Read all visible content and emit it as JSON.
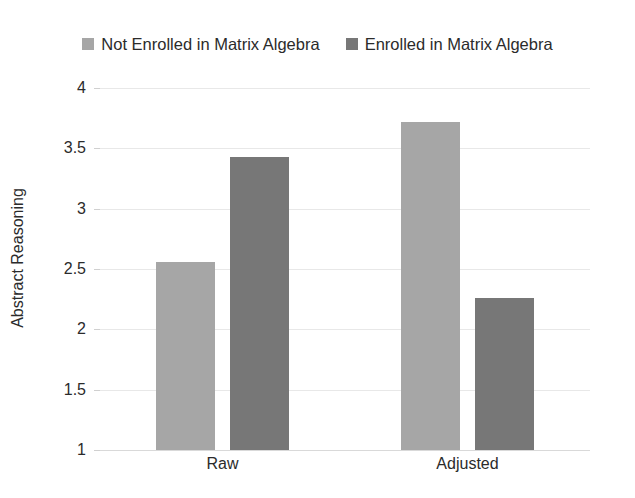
{
  "chart_data": {
    "type": "bar",
    "title": "",
    "subtitle": "",
    "xlabel": "",
    "ylabel": "Abstract Reasoning",
    "categories": [
      "Raw",
      "Adjusted"
    ],
    "series": [
      {
        "name": "Not Enrolled in Matrix Algebra",
        "color": "#a6a6a6",
        "values": [
          2.56,
          3.72
        ]
      },
      {
        "name": "Enrolled in Matrix Algebra",
        "color": "#777777",
        "values": [
          3.43,
          2.26
        ]
      }
    ],
    "ylim": [
      1,
      4
    ],
    "ytick_labels": [
      "4",
      "3.5",
      "3",
      "2.5",
      "2",
      "1.5",
      "1"
    ],
    "ytick_values": [
      4,
      3.5,
      3,
      2.5,
      2,
      1.5,
      1
    ],
    "grid": true,
    "grid_axis": "y",
    "legend_position": "top",
    "gridline_color": "#e8e8e8",
    "background_color": "#ffffff",
    "text_color": "#2b2b2b"
  },
  "legend": {
    "entries": [
      {
        "label": "Not Enrolled in Matrix Algebra",
        "color": "#a6a6a6",
        "swatch_name": "legend-swatch-not-enrolled"
      },
      {
        "label": "Enrolled in Matrix Algebra",
        "color": "#777777",
        "swatch_name": "legend-swatch-enrolled"
      }
    ]
  }
}
